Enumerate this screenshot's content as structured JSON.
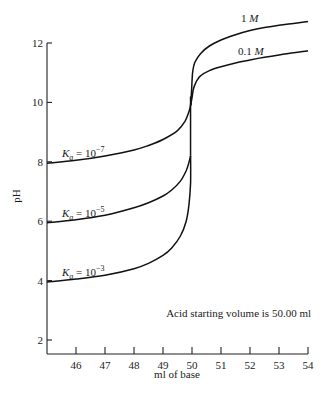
{
  "chart_data": {
    "type": "line",
    "title": "",
    "xlabel": "ml of base",
    "ylabel": "pH",
    "xlim": [
      45,
      54
    ],
    "ylim": [
      2,
      12
    ],
    "grid": false,
    "x_ticks": [
      46,
      47,
      48,
      49,
      50,
      51,
      52,
      53,
      54
    ],
    "y_ticks": [
      2,
      4,
      6,
      8,
      10,
      12
    ],
    "annotation": "Acid starting volume is 50.00 ml",
    "series": [
      {
        "name": "Ka = 10^-7",
        "label_base": "K",
        "label_sub": "a",
        "label_eq": " = 10",
        "label_sup": "−7",
        "x": [
          45.0,
          46.0,
          47.0,
          48.0,
          48.5,
          49.0,
          49.5,
          49.75,
          49.9,
          49.97
        ],
        "y": [
          7.95,
          8.05,
          8.2,
          8.4,
          8.55,
          8.75,
          9.05,
          9.35,
          9.7,
          10.0
        ]
      },
      {
        "name": "Ka = 10^-5",
        "label_base": "K",
        "label_sub": "a",
        "label_eq": " = 10",
        "label_sup": "−5",
        "x": [
          45.0,
          46.0,
          47.0,
          48.0,
          48.5,
          49.0,
          49.3,
          49.6,
          49.8,
          49.9,
          49.95
        ],
        "y": [
          5.95,
          6.05,
          6.2,
          6.45,
          6.62,
          6.85,
          7.05,
          7.35,
          7.7,
          8.0,
          8.2
        ]
      },
      {
        "name": "Ka = 10^-3",
        "label_base": "K",
        "label_sub": "a",
        "label_eq": " = 10",
        "label_sup": "−3",
        "x": [
          45.0,
          46.0,
          47.0,
          48.0,
          48.5,
          49.0,
          49.3,
          49.6,
          49.8,
          49.9,
          49.95,
          49.95
        ],
        "y": [
          3.95,
          4.05,
          4.18,
          4.4,
          4.58,
          4.85,
          5.1,
          5.5,
          6.0,
          6.6,
          7.3,
          8.2
        ]
      },
      {
        "name": "1 M",
        "label_num": "1 ",
        "label_unit": "M",
        "x": [
          49.95,
          49.98,
          50.02,
          50.1,
          50.3,
          50.6,
          51.0,
          51.5,
          52.0,
          52.5,
          53.0,
          53.5,
          54.0
        ],
        "y": [
          9.9,
          10.3,
          11.0,
          11.35,
          11.65,
          11.9,
          12.1,
          12.28,
          12.42,
          12.52,
          12.6,
          12.66,
          12.72
        ]
      },
      {
        "name": "0.1 M",
        "label_num": "0.1 ",
        "label_unit": "M",
        "x": [
          49.95,
          50.0,
          50.05,
          50.15,
          50.3,
          50.6,
          51.0,
          51.5,
          52.0,
          52.5,
          53.0,
          53.5,
          54.0
        ],
        "y": [
          9.9,
          10.15,
          10.45,
          10.7,
          10.9,
          11.07,
          11.2,
          11.33,
          11.43,
          11.52,
          11.6,
          11.67,
          11.74
        ]
      }
    ]
  },
  "labels": {
    "ylabel": "pH",
    "xlabel": "ml of base",
    "annotation": "Acid starting volume is 50.00 ml"
  }
}
